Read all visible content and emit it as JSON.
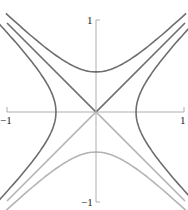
{
  "figure": {
    "axes": {
      "x_range": [
        -1,
        1
      ],
      "y_range": [
        -1,
        1
      ],
      "labels": {
        "x_min": "−1",
        "x_max": "1",
        "y_max": "1",
        "y_min": "−1"
      }
    },
    "colors": {
      "dark": "#6e6e6e",
      "light": "#b4b4b4",
      "axis": "#9a9a9a"
    },
    "curves": [
      {
        "name": "upper-branch",
        "equation": "y^2 - x^2 = 0.2, y>0",
        "color": "dark"
      },
      {
        "name": "lower-branch",
        "equation": "y^2 - x^2 = 0.2, y<0",
        "color": "light"
      },
      {
        "name": "left-branch",
        "equation": "x^2 - y^2 = 0.2, x<0",
        "color": "dark"
      },
      {
        "name": "right-branch",
        "equation": "x^2 - y^2 = 0.2, x>0",
        "color": "dark"
      },
      {
        "name": "asymptote-upper",
        "equation": "y = |x|, y>0",
        "color": "dark"
      },
      {
        "name": "asymptote-lower",
        "equation": "y = -|x|, y<0",
        "color": "light"
      }
    ]
  }
}
